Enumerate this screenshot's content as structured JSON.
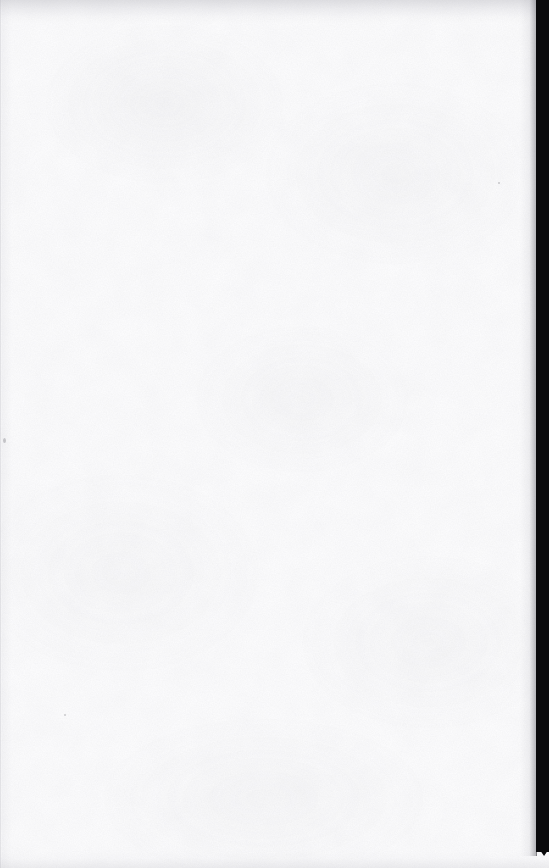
{
  "document": {
    "kind": "scanned-page-image",
    "page_label": "",
    "body_text": "",
    "header_text": "",
    "footer_text": "",
    "page_number_text": "",
    "caption": "",
    "is_blank": true
  },
  "canvas": {
    "width_px": 549,
    "height_px": 868,
    "background_color": "#fefeff"
  },
  "artifacts": {
    "right_gutter": {
      "label": "scan-gutter-band",
      "color": "#0a0a0c",
      "left_px": 536,
      "width_px": 13,
      "height_px": 852
    },
    "left_edge_rule": {
      "label": "page-trim-edge",
      "color": "#acacb4",
      "width_px": 2
    },
    "top_shadow": {
      "label": "top-edge-shadow",
      "color": "#a8a8b0",
      "height_px": 24
    },
    "bottom_shadow": {
      "label": "bottom-edge-shadow",
      "color": "#b0b0b8",
      "height_px": 18
    },
    "paper_noise": {
      "label": "paper-grain-speckle",
      "color": "#969699"
    }
  }
}
